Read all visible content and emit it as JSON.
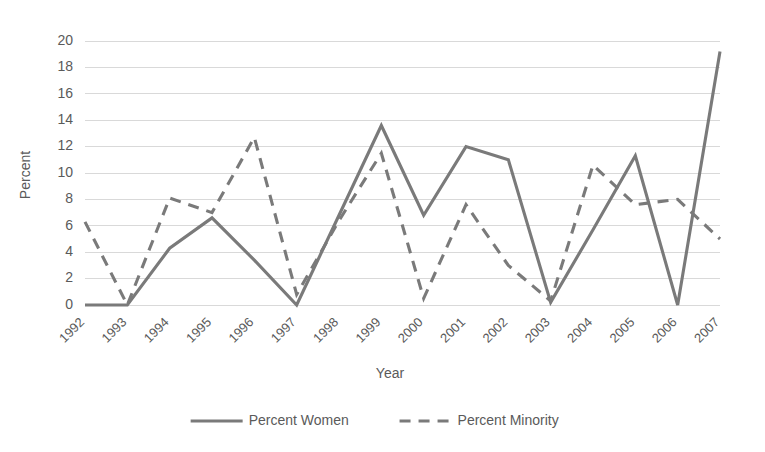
{
  "chart_data": {
    "type": "line",
    "title": "",
    "subtitle": "",
    "xlabel": "Year",
    "ylabel": "Percent",
    "categories": [
      "1992",
      "1993",
      "1994",
      "1995",
      "1996",
      "1997",
      "1998",
      "1999",
      "2000",
      "2001",
      "2002",
      "2003",
      "2004",
      "2005",
      "2006",
      "2007"
    ],
    "series": [
      {
        "name": "Percent Women",
        "style": "solid",
        "color": "#7a7a7a",
        "values": [
          0,
          0,
          4.3,
          6.6,
          3.4,
          0,
          6.8,
          13.6,
          6.8,
          12.0,
          11.0,
          0.2,
          5.7,
          11.3,
          0,
          19.2
        ]
      },
      {
        "name": "Percent Minority",
        "style": "dashed",
        "color": "#7a7a7a",
        "values": [
          6.3,
          0,
          8.1,
          7.0,
          12.7,
          0.8,
          6.4,
          11.5,
          0.5,
          7.6,
          3.0,
          0.3,
          10.6,
          7.6,
          8.0,
          5.0
        ]
      }
    ],
    "ylim": [
      0,
      20
    ],
    "ytick_values": [
      0,
      2,
      4,
      6,
      8,
      10,
      12,
      14,
      16,
      18,
      20
    ],
    "ytick_labels": [
      "0",
      "2",
      "4",
      "6",
      "8",
      "10",
      "12",
      "14",
      "16",
      "18",
      "20"
    ],
    "grid": true,
    "grid_axis": "y",
    "grid_color": "#d9d9d9",
    "legend_position": "bottom",
    "background": "#ffffff",
    "xtick_rotation": -45
  },
  "legend": {
    "entries": [
      {
        "label": "Percent Women"
      },
      {
        "label": "Percent Minority"
      }
    ]
  }
}
